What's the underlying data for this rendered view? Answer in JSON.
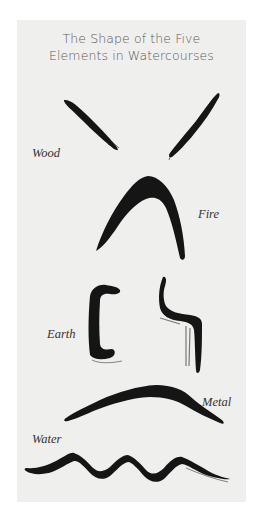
{
  "figure": {
    "title_line1": "The Shape of the Five",
    "title_line2": "Elements in Watercourses",
    "background_color": "#efefed",
    "ink_color": "#151515",
    "elements": [
      {
        "name": "Wood",
        "shape": "two diagonal brush strokes forming a V"
      },
      {
        "name": "Fire",
        "shape": "pointed arch / inverted V brush stroke"
      },
      {
        "name": "Earth",
        "shape": "two angular bracket-like brush strokes"
      },
      {
        "name": "Metal",
        "shape": "smooth rounded dome brush stroke"
      },
      {
        "name": "Water",
        "shape": "wavy serpentine brush stroke"
      }
    ]
  }
}
